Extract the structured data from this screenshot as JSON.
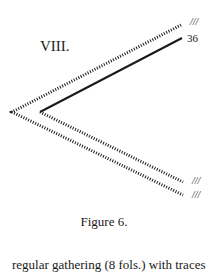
{
  "figure": {
    "section_label": "VIII.",
    "caption": "Figure 6.",
    "line_labels": {
      "upper_outer": "///",
      "upper_inner": "36",
      "lower_inner": "///",
      "lower_outer": "///"
    },
    "colors": {
      "ink": "#1a1a1a",
      "background": "#ffffff"
    }
  },
  "body_text": "regular gathering (8 fols.) with traces"
}
